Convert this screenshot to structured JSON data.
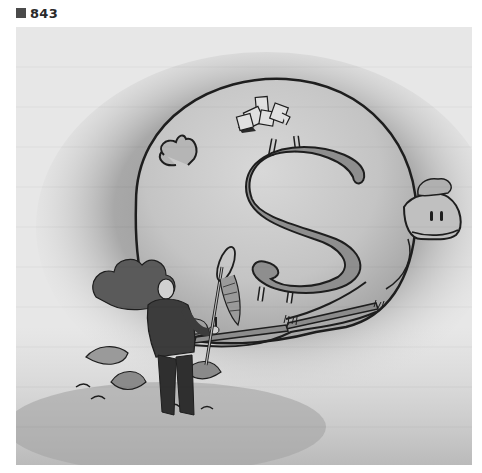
{
  "figure": {
    "label_icon": "square-bullet-icon",
    "number": "843"
  },
  "illustration": {
    "subject": "Giant piggy bank with dollar sign, man with butterfly net hiding in bushes",
    "colors": {
      "background_light": "#e8e8e8",
      "shadow_wash": "#9a9a9a",
      "body_fill": "#c9c9c9",
      "dollar_fill": "#8a8a8a",
      "ink": "#1e1e1e",
      "figure_dark": "#3a3a3a"
    }
  }
}
